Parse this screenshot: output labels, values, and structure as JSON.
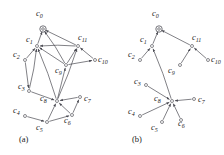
{
  "figure": {
    "width": 224,
    "height": 155,
    "background": "#ffffff",
    "edge_color": "#4a4a52",
    "node_color": "#3a3a42"
  },
  "panels": [
    {
      "id": "a",
      "caption": "(a)",
      "caption_pos": {
        "x": 19,
        "y": 142
      },
      "nodes": [
        {
          "id": "c0",
          "label": "c",
          "sub": "0",
          "x": 43,
          "y": 29,
          "label_x": 36,
          "label_y": 16,
          "root": true
        },
        {
          "id": "c1",
          "label": "c",
          "sub": "1",
          "x": 37,
          "y": 46,
          "label_x": 26,
          "label_y": 42
        },
        {
          "id": "c2",
          "label": "c",
          "sub": "2",
          "x": 25,
          "y": 60,
          "label_x": 13,
          "label_y": 57
        },
        {
          "id": "c3",
          "label": "c",
          "sub": "3",
          "x": 29,
          "y": 91,
          "label_x": 18,
          "label_y": 89
        },
        {
          "id": "c4",
          "label": "c",
          "sub": "4",
          "x": 25,
          "y": 116,
          "label_x": 13,
          "label_y": 113
        },
        {
          "id": "c5",
          "label": "c",
          "sub": "5",
          "x": 47,
          "y": 122,
          "label_x": 36,
          "label_y": 130
        },
        {
          "id": "c6",
          "label": "c",
          "sub": "6",
          "x": 72,
          "y": 115,
          "label_x": 64,
          "label_y": 123
        },
        {
          "id": "c7",
          "label": "c",
          "sub": "7",
          "x": 80,
          "y": 97,
          "label_x": 84,
          "label_y": 101
        },
        {
          "id": "c8",
          "label": "c",
          "sub": "8",
          "x": 57,
          "y": 101,
          "label_x": 40,
          "label_y": 101
        },
        {
          "id": "c9",
          "label": "c",
          "sub": "9",
          "x": 66,
          "y": 65,
          "label_x": 55,
          "label_y": 73
        },
        {
          "id": "c10",
          "label": "c",
          "sub": "10",
          "x": 95,
          "y": 60,
          "label_x": 98,
          "label_y": 62
        },
        {
          "id": "c11",
          "label": "c",
          "sub": "11",
          "x": 78,
          "y": 46,
          "label_x": 78,
          "label_y": 40
        }
      ],
      "edges": [
        {
          "from": "c1",
          "to": "c0"
        },
        {
          "from": "c11",
          "to": "c0"
        },
        {
          "from": "c9",
          "to": "c0"
        },
        {
          "from": "c2",
          "to": "c1"
        },
        {
          "from": "c3",
          "to": "c1"
        },
        {
          "from": "c8",
          "to": "c1"
        },
        {
          "from": "c9",
          "to": "c1"
        },
        {
          "from": "c11",
          "to": "c1"
        },
        {
          "from": "c9",
          "to": "c11"
        },
        {
          "from": "c10",
          "to": "c11"
        },
        {
          "from": "c8",
          "to": "c11"
        },
        {
          "from": "c9",
          "to": "c10"
        },
        {
          "from": "c8",
          "to": "c9"
        },
        {
          "from": "c3",
          "to": "c8"
        },
        {
          "from": "c5",
          "to": "c8"
        },
        {
          "from": "c6",
          "to": "c8"
        },
        {
          "from": "c7",
          "to": "c8"
        },
        {
          "from": "c2",
          "to": "c3"
        },
        {
          "from": "c4",
          "to": "c5"
        },
        {
          "from": "c5",
          "to": "c6"
        },
        {
          "from": "c6",
          "to": "c7"
        }
      ]
    },
    {
      "id": "b",
      "caption": "(b)",
      "caption_pos": {
        "x": 132,
        "y": 142
      },
      "nodes": [
        {
          "id": "c0",
          "label": "c",
          "sub": "0",
          "x": 159,
          "y": 29,
          "label_x": 152,
          "label_y": 16,
          "root": true
        },
        {
          "id": "c1",
          "label": "c",
          "sub": "1",
          "x": 152,
          "y": 46,
          "label_x": 140,
          "label_y": 42
        },
        {
          "id": "c2",
          "label": "c",
          "sub": "2",
          "x": 140,
          "y": 60,
          "label_x": 128,
          "label_y": 57
        },
        {
          "id": "c3",
          "label": "c",
          "sub": "3",
          "x": 146,
          "y": 85,
          "label_x": 134,
          "label_y": 84
        },
        {
          "id": "c4",
          "label": "c",
          "sub": "4",
          "x": 140,
          "y": 116,
          "label_x": 128,
          "label_y": 114
        },
        {
          "id": "c5",
          "label": "c",
          "sub": "5",
          "x": 162,
          "y": 122,
          "label_x": 151,
          "label_y": 130
        },
        {
          "id": "c6",
          "label": "c",
          "sub": "6",
          "x": 181,
          "y": 120,
          "label_x": 178,
          "label_y": 126
        },
        {
          "id": "c7",
          "label": "c",
          "sub": "7",
          "x": 194,
          "y": 99,
          "label_x": 198,
          "label_y": 102
        },
        {
          "id": "c8",
          "label": "c",
          "sub": "8",
          "x": 172,
          "y": 101,
          "label_x": 154,
          "label_y": 101
        },
        {
          "id": "c9",
          "label": "c",
          "sub": "9",
          "x": 180,
          "y": 65,
          "label_x": 168,
          "label_y": 73
        },
        {
          "id": "c10",
          "label": "c",
          "sub": "10",
          "x": 208,
          "y": 60,
          "label_x": 211,
          "label_y": 62
        },
        {
          "id": "c11",
          "label": "c",
          "sub": "11",
          "x": 192,
          "y": 46,
          "label_x": 192,
          "label_y": 40
        }
      ],
      "edges": [
        {
          "from": "c1",
          "to": "c0"
        },
        {
          "from": "c11",
          "to": "c0"
        },
        {
          "from": "c2",
          "to": "c1"
        },
        {
          "from": "c8",
          "to": "c1"
        },
        {
          "from": "c9",
          "to": "c11"
        },
        {
          "from": "c10",
          "to": "c11"
        },
        {
          "from": "c3",
          "to": "c8"
        },
        {
          "from": "c4",
          "to": "c8"
        },
        {
          "from": "c5",
          "to": "c8"
        },
        {
          "from": "c6",
          "to": "c8"
        },
        {
          "from": "c7",
          "to": "c8"
        }
      ]
    }
  ]
}
